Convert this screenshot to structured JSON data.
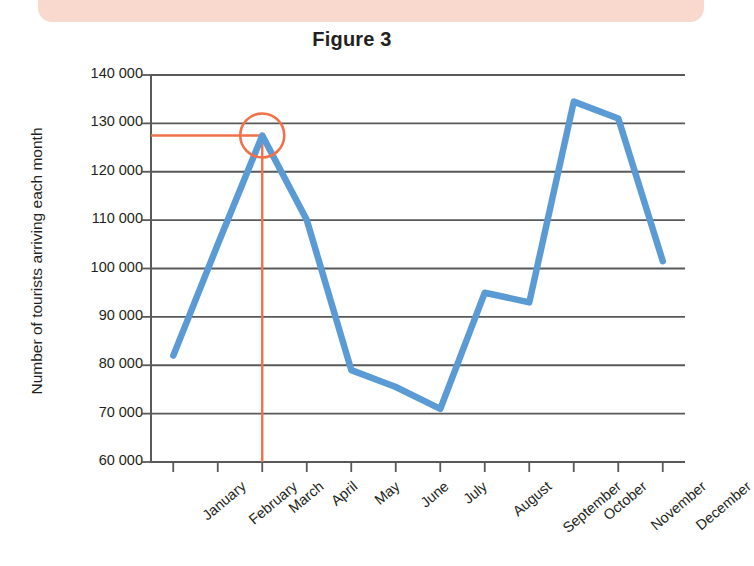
{
  "banner": {
    "name": "top-decorative-banner",
    "color": "#f9d8cd"
  },
  "chart_data": {
    "type": "line",
    "title": "Figure 3",
    "xlabel": "",
    "ylabel": "Number of tourists arriving each month",
    "categories": [
      "January",
      "February",
      "March",
      "April",
      "May",
      "June",
      "July",
      "August",
      "September",
      "October",
      "November",
      "December"
    ],
    "values": [
      82000,
      105000,
      127500,
      110000,
      79000,
      75500,
      71000,
      95000,
      93000,
      134500,
      131000,
      101500
    ],
    "series": [
      {
        "name": "Number of tourists arriving each month",
        "color": "#5b9bd5",
        "values": [
          82000,
          105000,
          127500,
          110000,
          79000,
          75500,
          71000,
          95000,
          93000,
          134500,
          131000,
          101500
        ]
      }
    ],
    "ylim": [
      60000,
      140000
    ],
    "ytick_step": 10000,
    "ytick_labels": [
      "140 000",
      "130 000",
      "120 000",
      "110 000",
      "100 000",
      "90 000",
      "80 000",
      "70 000",
      "60 000"
    ],
    "ytick_values": [
      140000,
      130000,
      120000,
      110000,
      100000,
      90000,
      80000,
      70000,
      60000
    ],
    "grid": true,
    "grid_color": "#58595b",
    "legend": "none",
    "annotations": [
      {
        "kind": "highlight-circle",
        "at_category": "March",
        "at_value": 127500,
        "color": "#f0714a",
        "label": ""
      },
      {
        "kind": "horizontal-reference-line",
        "at_value": 127500,
        "color": "#f0714a",
        "from_axis": "y-axis",
        "to_category": "March",
        "label": ""
      },
      {
        "kind": "vertical-reference-line",
        "at_category": "March",
        "color": "#f0714a",
        "from_value": 127500,
        "to_value": 60000,
        "label": ""
      }
    ]
  }
}
